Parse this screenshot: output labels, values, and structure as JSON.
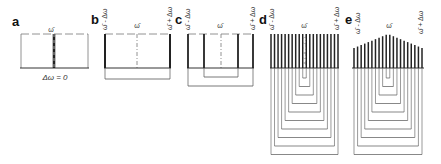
{
  "figure": {
    "panels": [
      {
        "id": "a",
        "letter": "a",
        "center_label": "ω̄",
        "bottom_label": "Δω = 0",
        "num_lines": 1
      },
      {
        "id": "b",
        "letter": "b",
        "left_label": "ω̄ - Δω",
        "center_label": "ω̄",
        "right_label": "ω̄ + Δω",
        "num_lines": 2
      },
      {
        "id": "c",
        "letter": "c",
        "left_label": "ω̄ - Δω",
        "center_label": "ω̄",
        "right_label": "ω̄ + Δω",
        "num_lines": 4
      },
      {
        "id": "d",
        "letter": "d",
        "left_label": "ω̄ - Δω",
        "center_label": "ω̄",
        "right_label": "ω̄ + Δω",
        "num_lines": 20,
        "profile": "flat"
      },
      {
        "id": "e",
        "letter": "e",
        "left_label": "ω̄ - Δω",
        "center_label": "ω̄",
        "right_label": "ω̄ + Δω",
        "num_lines": 20,
        "profile": "peaked"
      }
    ],
    "colors": {
      "line": "#222222",
      "thin": "#555555",
      "background": "#ffffff"
    }
  }
}
